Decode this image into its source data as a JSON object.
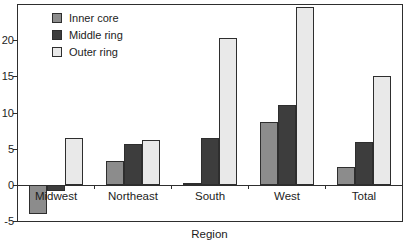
{
  "chart_data": {
    "type": "bar",
    "title": "",
    "xlabel": "Region",
    "ylabel": "",
    "categories": [
      "Midwest",
      "Northeast",
      "South",
      "West",
      "Total"
    ],
    "series": [
      {
        "name": "Inner core",
        "color": "#8c8c8c",
        "values": [
          -4.0,
          3.3,
          0.2,
          8.7,
          2.5
        ]
      },
      {
        "name": "Middle ring",
        "color": "#3d3d3d",
        "values": [
          -0.8,
          5.7,
          6.5,
          11.0,
          5.9
        ]
      },
      {
        "name": "Outer ring",
        "color": "#e9e9e9",
        "values": [
          6.5,
          6.2,
          20.3,
          24.6,
          15.1
        ]
      }
    ],
    "ylim": [
      -5,
      25
    ],
    "yticks": [
      -5,
      0,
      5,
      10,
      15,
      20
    ],
    "grid": false,
    "legend_position": "upper-left-inside",
    "bar_outline_color": "#2e2e2e",
    "axis_color": "#2e2e2e",
    "text_color": "#1c1c1c",
    "background_color": "#ffffff"
  }
}
